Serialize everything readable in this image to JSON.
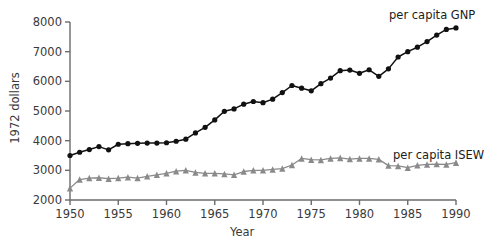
{
  "chart_data": {
    "type": "line",
    "title": "",
    "subtitle": "",
    "xlabel": "Year",
    "ylabel": "1972 dollars",
    "xlim": [
      1950,
      1990
    ],
    "ylim": [
      2000,
      8000
    ],
    "xticks": [
      1950,
      1955,
      1960,
      1965,
      1970,
      1975,
      1980,
      1985,
      1990
    ],
    "yticks": [
      2000,
      3000,
      4000,
      5000,
      6000,
      7000,
      8000
    ],
    "xticklabels": [
      "1950",
      "1955",
      "1960",
      "1965",
      "1970",
      "1975",
      "1980",
      "1985",
      "1990"
    ],
    "yticklabels": [
      "2000",
      "3000",
      "4000",
      "5000",
      "6000",
      "7000",
      "8000"
    ],
    "grid": false,
    "legend_position": "inline-annotation",
    "x": [
      1950,
      1951,
      1952,
      1953,
      1954,
      1955,
      1956,
      1957,
      1958,
      1959,
      1960,
      1961,
      1962,
      1963,
      1964,
      1965,
      1966,
      1967,
      1968,
      1969,
      1970,
      1971,
      1972,
      1973,
      1974,
      1975,
      1976,
      1977,
      1978,
      1979,
      1980,
      1981,
      1982,
      1983,
      1984,
      1985,
      1986,
      1987,
      1988,
      1989,
      1990
    ],
    "series": [
      {
        "name": "per capita GNP",
        "color": "#111111",
        "marker": "circle",
        "values": [
          3500,
          3610,
          3700,
          3800,
          3690,
          3880,
          3900,
          3910,
          3920,
          3920,
          3930,
          3980,
          4050,
          4260,
          4450,
          4700,
          4990,
          5070,
          5230,
          5320,
          5280,
          5400,
          5620,
          5860,
          5770,
          5680,
          5920,
          6110,
          6360,
          6380,
          6270,
          6390,
          6170,
          6420,
          6820,
          7000,
          7150,
          7340,
          7560,
          7750,
          7800
        ]
      },
      {
        "name": "per capita ISEW",
        "color": "#8a8a8a",
        "marker": "triangle",
        "values": [
          2400,
          2690,
          2740,
          2750,
          2720,
          2740,
          2770,
          2740,
          2800,
          2850,
          2900,
          2970,
          3000,
          2930,
          2900,
          2900,
          2880,
          2850,
          2960,
          3000,
          3000,
          3030,
          3060,
          3180,
          3400,
          3360,
          3350,
          3400,
          3420,
          3380,
          3400,
          3400,
          3370,
          3160,
          3150,
          3090,
          3170,
          3200,
          3210,
          3200,
          3260
        ]
      }
    ],
    "annotations": [
      {
        "text": "per capita GNP",
        "x_px": 389,
        "y_px": 8
      },
      {
        "text": "per capita ISEW",
        "x_px": 393,
        "y_px": 148
      }
    ],
    "axis_color": "#6b6b6b",
    "text_color": "#3a3a3a"
  }
}
